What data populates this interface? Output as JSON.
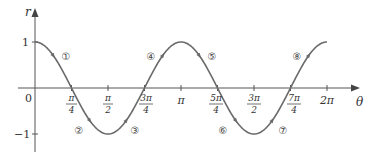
{
  "chart_data": {
    "type": "line",
    "title": "",
    "function": "r = cos(2θ)",
    "xlabel": "θ",
    "ylabel": "r",
    "xlim": [
      0,
      6.2832
    ],
    "ylim": [
      -1,
      1
    ],
    "grid": false,
    "legend": null,
    "x_ticks": [
      {
        "value": 0.7854,
        "label_num": "π",
        "label_den": "4"
      },
      {
        "value": 1.5708,
        "label_num": "π",
        "label_den": "2"
      },
      {
        "value": 2.3562,
        "label_num": "3π",
        "label_den": "4"
      },
      {
        "value": 3.1416,
        "label": "π"
      },
      {
        "value": 3.927,
        "label_num": "5π",
        "label_den": "4"
      },
      {
        "value": 4.7124,
        "label_num": "3π",
        "label_den": "2"
      },
      {
        "value": 5.4978,
        "label_num": "7π",
        "label_den": "4"
      },
      {
        "value": 6.2832,
        "label": "2π"
      }
    ],
    "y_ticks": [
      {
        "value": 1,
        "label": "1"
      },
      {
        "value": -1,
        "label": "−1"
      }
    ],
    "origin_label": "0",
    "x": [
      0,
      0.7854,
      1.5708,
      2.3562,
      3.1416,
      3.927,
      4.7124,
      5.4978,
      6.2832
    ],
    "series": [
      {
        "name": "r = cos 2θ",
        "values": [
          1,
          0,
          -1,
          0,
          1,
          0,
          -1,
          0,
          1
        ]
      }
    ],
    "annotations": [
      {
        "label": "①",
        "x": 0.39,
        "y": 0.7
      },
      {
        "label": "②",
        "x": 1.13,
        "y": -0.9
      },
      {
        "label": "③",
        "x": 2.0,
        "y": -0.9
      },
      {
        "label": "④",
        "x": 2.7,
        "y": 0.7
      },
      {
        "label": "⑤",
        "x": 3.7,
        "y": 0.7
      },
      {
        "label": "⑥",
        "x": 4.0,
        "y": -0.9
      },
      {
        "label": "⑦",
        "x": 5.05,
        "y": -0.9
      },
      {
        "label": "⑧",
        "x": 5.55,
        "y": 0.7
      }
    ]
  },
  "labels": {
    "r": "r",
    "theta": "θ",
    "origin": "0",
    "one": "1",
    "neg_one": "−1",
    "pi": "π",
    "two_pi": "2π",
    "pi4_num": "π",
    "pi4_den": "4",
    "pi2_num": "π",
    "pi2_den": "2",
    "three_pi4_num": "3π",
    "three_pi4_den": "4",
    "five_pi4_num": "5π",
    "five_pi4_den": "4",
    "three_pi2_num": "3π",
    "three_pi2_den": "2",
    "seven_pi4_num": "7π",
    "seven_pi4_den": "4",
    "c1": "①",
    "c2": "②",
    "c3": "③",
    "c4": "④",
    "c5": "⑤",
    "c6": "⑥",
    "c7": "⑦",
    "c8": "⑧"
  },
  "colors": {
    "curve": "#6a6a6a",
    "axis": "#555555",
    "text": "#333333"
  }
}
